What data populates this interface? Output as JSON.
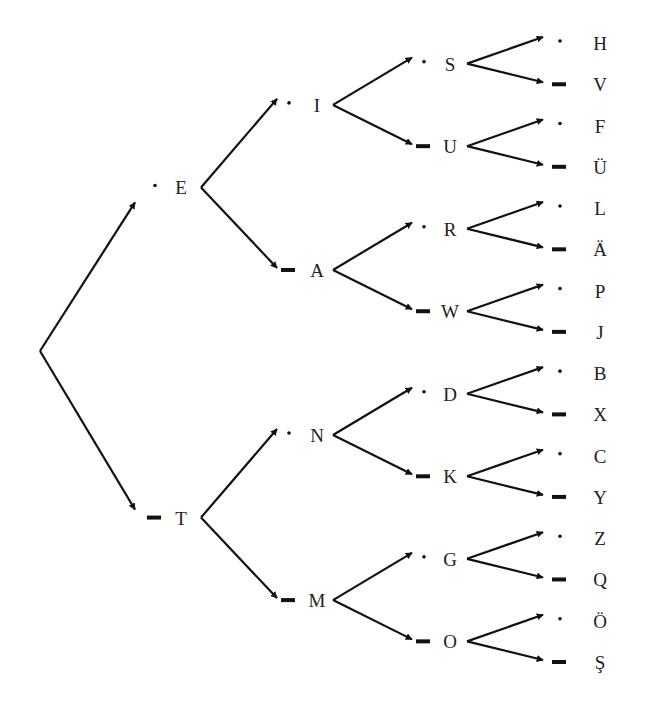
{
  "diagram": {
    "type": "morse-code-binary-tree",
    "legend": {
      "dot": "·",
      "dash": "–"
    },
    "colors": {
      "ink": "#111111",
      "text": "#222222",
      "background": "#ffffff"
    },
    "root": {
      "children": [
        {
          "letter": "E",
          "code": "dot",
          "children": [
            {
              "letter": "I",
              "code": "dot",
              "children": [
                {
                  "letter": "S",
                  "code": "dot",
                  "children": [
                    {
                      "letter": "H",
                      "code": "dot"
                    },
                    {
                      "letter": "V",
                      "code": "dash"
                    }
                  ]
                },
                {
                  "letter": "U",
                  "code": "dash",
                  "children": [
                    {
                      "letter": "F",
                      "code": "dot"
                    },
                    {
                      "letter": "Ü",
                      "code": "dash"
                    }
                  ]
                }
              ]
            },
            {
              "letter": "A",
              "code": "dash",
              "children": [
                {
                  "letter": "R",
                  "code": "dot",
                  "children": [
                    {
                      "letter": "L",
                      "code": "dot"
                    },
                    {
                      "letter": "Ä",
                      "code": "dash"
                    }
                  ]
                },
                {
                  "letter": "W",
                  "code": "dash",
                  "children": [
                    {
                      "letter": "P",
                      "code": "dot"
                    },
                    {
                      "letter": "J",
                      "code": "dash"
                    }
                  ]
                }
              ]
            }
          ]
        },
        {
          "letter": "T",
          "code": "dash",
          "children": [
            {
              "letter": "N",
              "code": "dot",
              "children": [
                {
                  "letter": "D",
                  "code": "dot",
                  "children": [
                    {
                      "letter": "B",
                      "code": "dot"
                    },
                    {
                      "letter": "X",
                      "code": "dash"
                    }
                  ]
                },
                {
                  "letter": "K",
                  "code": "dash",
                  "children": [
                    {
                      "letter": "C",
                      "code": "dot"
                    },
                    {
                      "letter": "Y",
                      "code": "dash"
                    }
                  ]
                }
              ]
            },
            {
              "letter": "M",
              "code": "dash",
              "children": [
                {
                  "letter": "G",
                  "code": "dot",
                  "children": [
                    {
                      "letter": "Z",
                      "code": "dot"
                    },
                    {
                      "letter": "Q",
                      "code": "dash"
                    }
                  ]
                },
                {
                  "letter": "O",
                  "code": "dash",
                  "children": [
                    {
                      "letter": "Ö",
                      "code": "dot"
                    },
                    {
                      "letter": "Ş",
                      "code": "dash"
                    }
                  ]
                }
              ]
            }
          ]
        }
      ]
    }
  }
}
